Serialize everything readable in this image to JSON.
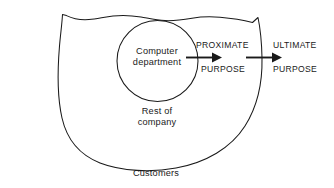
{
  "diagram": {
    "stroke_color": "#1a1a1a",
    "background_color": "#ffffff",
    "inner_circle": {
      "label_line1": "Computer",
      "label_line2": "department"
    },
    "outer_blob": {
      "label_line1": "Rest of",
      "label_line2": "company"
    },
    "outside_label": "Customers",
    "flow": [
      {
        "id": "proximate",
        "line1": "PROXIMATE",
        "line2": "PURPOSE"
      },
      {
        "id": "ultimate",
        "line1": "ULTIMATE",
        "line2": "PURPOSE"
      }
    ],
    "arrows": [
      {
        "id": "arrow-to-proximate"
      },
      {
        "id": "arrow-to-ultimate"
      }
    ]
  }
}
